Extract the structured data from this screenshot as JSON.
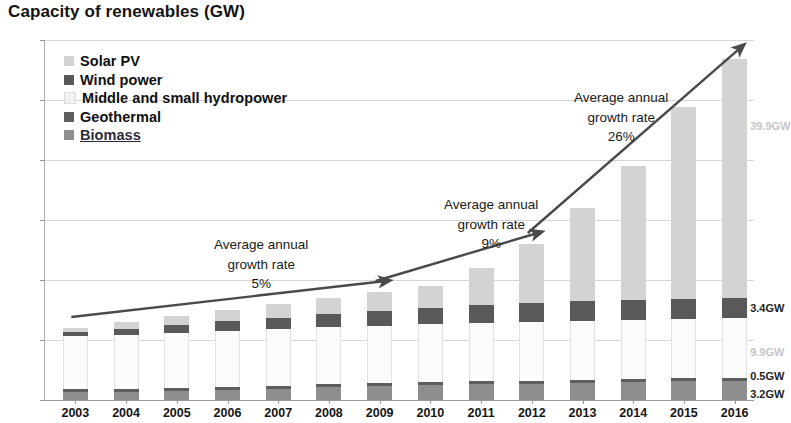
{
  "chart_data": {
    "type": "bar",
    "title": "Capacity of renewables (GW)",
    "xlabel": "",
    "ylabel": "",
    "ylim": [
      0,
      60
    ],
    "ytick_step": 10,
    "yticks": [
      "0",
      "10",
      "20",
      "30",
      "40",
      "50",
      "60"
    ],
    "grid": true,
    "stacked": true,
    "legend_position": "top-left-inside",
    "categories": [
      "2003",
      "2004",
      "2005",
      "2006",
      "2007",
      "2008",
      "2009",
      "2010",
      "2011",
      "2012",
      "2013",
      "2014",
      "2015",
      "2016"
    ],
    "series": [
      {
        "name": "Biomass",
        "color": "#8e8e8e",
        "values": [
          1.3,
          1.4,
          1.5,
          1.7,
          1.9,
          2.1,
          2.3,
          2.5,
          2.6,
          2.7,
          2.8,
          3.0,
          3.1,
          3.2
        ]
      },
      {
        "name": "Geothermal",
        "color": "#5e5e5e",
        "values": [
          0.5,
          0.5,
          0.5,
          0.5,
          0.5,
          0.5,
          0.5,
          0.5,
          0.5,
          0.5,
          0.5,
          0.5,
          0.5,
          0.5
        ]
      },
      {
        "name": "Middle and small hydropower",
        "color": "#fbfbfb",
        "values": [
          8.8,
          9.0,
          9.2,
          9.3,
          9.4,
          9.5,
          9.6,
          9.7,
          9.8,
          9.8,
          9.9,
          9.9,
          9.9,
          9.9
        ]
      },
      {
        "name": "Wind power",
        "color": "#595959",
        "values": [
          0.8,
          1.0,
          1.3,
          1.7,
          1.9,
          2.2,
          2.5,
          2.7,
          3.0,
          3.2,
          3.3,
          3.3,
          3.4,
          3.4
        ]
      },
      {
        "name": "Solar PV",
        "color": "#d3d3d3",
        "values": [
          0.6,
          1.1,
          1.5,
          1.8,
          2.3,
          2.7,
          3.1,
          3.6,
          6.1,
          9.8,
          15.5,
          22.3,
          32.0,
          39.9
        ]
      }
    ],
    "totals": [
      12.0,
      13.0,
      14.0,
      15.0,
      16.0,
      17.0,
      18.0,
      19.0,
      22.0,
      26.0,
      32.0,
      39.0,
      48.9,
      56.9
    ],
    "annotations": [
      {
        "name": "growth-rate-1",
        "line1": "Average annual",
        "line2": "growth rate",
        "value": "5%",
        "span": "2003-2009"
      },
      {
        "name": "growth-rate-2",
        "line1": "Average annual",
        "line2": "growth rate",
        "value": "9%",
        "span": "2009-2012"
      },
      {
        "name": "growth-rate-3",
        "line1": "Average annual",
        "line2": "growth rate",
        "value": "26%",
        "span": "2012-2016"
      }
    ],
    "value_labels_2016": [
      {
        "name": "solar-2016-label",
        "text": "39.9GW",
        "series": "Solar PV"
      },
      {
        "name": "wind-2016-label",
        "text": "3.4GW",
        "series": "Wind power"
      },
      {
        "name": "hydro-2016-label",
        "text": "9.9GW",
        "series": "Middle and small hydropower"
      },
      {
        "name": "geothermal-2016-label",
        "text": "0.5GW",
        "series": "Geothermal"
      },
      {
        "name": "biomass-2016-label",
        "text": "3.2GW",
        "series": "Biomass"
      }
    ]
  },
  "legend": {
    "items": [
      {
        "label": "Solar PV",
        "color": "#d3d3d3",
        "linked": false
      },
      {
        "label": "Wind power",
        "color": "#595959",
        "linked": false
      },
      {
        "label": "Middle and small hydropower",
        "color": "#f2f2f2",
        "linked": false
      },
      {
        "label": "Geothermal",
        "color": "#5e5e5e",
        "linked": false
      },
      {
        "label": "Biomass",
        "color": "#8e8e8e",
        "linked": true
      }
    ]
  }
}
